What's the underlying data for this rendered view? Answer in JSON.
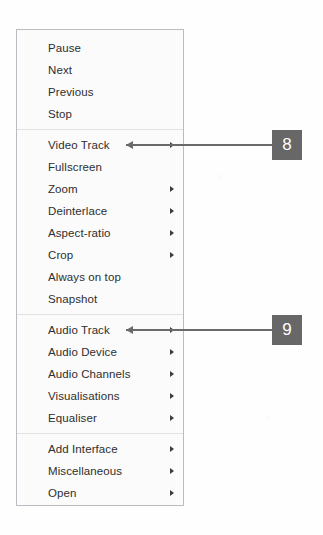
{
  "figure": {
    "background_color": "#fefefe",
    "menu_background_color": "#fbfbfb",
    "menu_border_color": "#b9bcc0",
    "badge_color": "#676767",
    "badge_text_color": "#ffffff",
    "connector_color": "#6a6a6a",
    "text_color": "#2e2e2e"
  },
  "context_menu": {
    "name": "playback-context-menu",
    "groups": [
      {
        "name": "playback-controls-group",
        "items": [
          {
            "label": "Pause",
            "has_submenu": false
          },
          {
            "label": "Next",
            "has_submenu": false
          },
          {
            "label": "Previous",
            "has_submenu": false
          },
          {
            "label": "Stop",
            "has_submenu": false
          }
        ]
      },
      {
        "name": "video-group",
        "items": [
          {
            "label": "Video Track",
            "has_submenu": true
          },
          {
            "label": "Fullscreen",
            "has_submenu": false
          },
          {
            "label": "Zoom",
            "has_submenu": true
          },
          {
            "label": "Deinterlace",
            "has_submenu": true
          },
          {
            "label": "Aspect-ratio",
            "has_submenu": true
          },
          {
            "label": "Crop",
            "has_submenu": true
          },
          {
            "label": "Always on top",
            "has_submenu": false
          },
          {
            "label": "Snapshot",
            "has_submenu": false
          }
        ]
      },
      {
        "name": "audio-group",
        "items": [
          {
            "label": "Audio Track",
            "has_submenu": true
          },
          {
            "label": "Audio Device",
            "has_submenu": true
          },
          {
            "label": "Audio Channels",
            "has_submenu": true
          },
          {
            "label": "Visualisations",
            "has_submenu": true
          },
          {
            "label": "Equaliser",
            "has_submenu": true
          }
        ]
      },
      {
        "name": "tools-group",
        "items": [
          {
            "label": "Add Interface",
            "has_submenu": true
          },
          {
            "label": "Miscellaneous",
            "has_submenu": true
          },
          {
            "label": "Open",
            "has_submenu": true
          }
        ]
      }
    ]
  },
  "callouts": [
    {
      "name": "callout-8",
      "number": "8",
      "target_label": "Video Track",
      "badge": {
        "x": 272,
        "y": 130
      },
      "line": {
        "x": 126,
        "y": 144,
        "width": 146
      },
      "arrowhead": {
        "x": 126,
        "y": 141
      }
    },
    {
      "name": "callout-9",
      "number": "9",
      "target_label": "Audio Track",
      "badge": {
        "x": 272,
        "y": 315
      },
      "line": {
        "x": 126,
        "y": 329,
        "width": 146
      },
      "arrowhead": {
        "x": 126,
        "y": 326
      }
    }
  ]
}
